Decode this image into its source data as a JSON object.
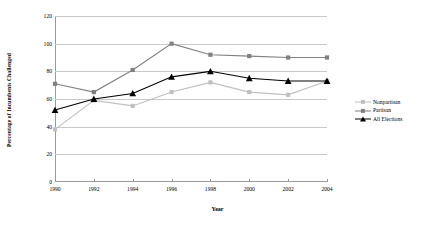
{
  "chart_data": {
    "type": "line",
    "title": "",
    "xlabel": "Year",
    "ylabel": "Percentage of Incumbents Challenged",
    "categories": [
      1990,
      1992,
      1994,
      1996,
      1998,
      2000,
      2002,
      2004
    ],
    "xtick_labels": [
      "1990",
      "1992",
      "1994",
      "1996",
      "1998",
      "2000",
      "2002",
      "2004"
    ],
    "ytick_labels": [
      "0",
      "20",
      "40",
      "60",
      "80",
      "100",
      "120"
    ],
    "ylim": [
      0,
      120
    ],
    "ytick_step": 20,
    "grid": "horizontal",
    "legend_position": "right",
    "series": [
      {
        "name": "Nonpartisan",
        "color": "#c0c0c0",
        "marker": "square",
        "values": [
          38,
          59,
          55,
          65,
          72,
          65,
          63,
          73
        ]
      },
      {
        "name": "Partisan",
        "color": "#808080",
        "marker": "square",
        "values": [
          71,
          65,
          81,
          100,
          92,
          91,
          90,
          90
        ]
      },
      {
        "name": "All Elections",
        "color": "#000000",
        "marker": "triangle",
        "values": [
          52,
          60,
          64,
          76,
          80,
          75,
          73,
          73
        ]
      }
    ]
  },
  "legend": {
    "entries": [
      "Nonpartisan",
      "Partisan",
      "All Elections"
    ]
  }
}
